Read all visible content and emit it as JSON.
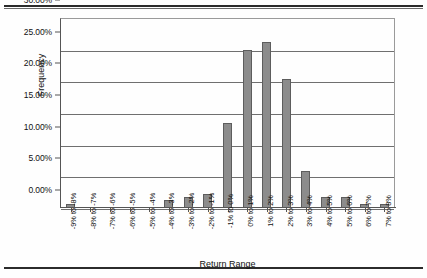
{
  "chart_data": {
    "type": "bar",
    "title": "",
    "xlabel": "Return Range",
    "ylabel": "Frequency",
    "ylim": [
      0,
      30
    ],
    "ytick_labels": [
      "30.00%",
      "25.00%",
      "20.00%",
      "15.00%",
      "10.00%",
      "5.00%",
      "0.00%"
    ],
    "ytick_values": [
      30,
      25,
      20,
      15,
      10,
      5,
      0
    ],
    "grid": true,
    "legend": "none",
    "bar_color": "#8c8c8c",
    "bar_edge_color": "#5d5d5d",
    "categories": [
      "-9% to -8%",
      "-8% to -7%",
      "-7% to -6%",
      "-6% to -5%",
      "-5% to -4%",
      "-4% to -3%",
      "-3% to -2%",
      "-2% to -1%",
      "-1% to 0%",
      "0% to 1%",
      "1% to 2%",
      "2% to 3%",
      "3% to 4%",
      "4% to 5%",
      "5% to 6%",
      "6% to 7%",
      "7% to 8%"
    ],
    "values": [
      0.6,
      0,
      0,
      0,
      0,
      1.2,
      1.7,
      2.2,
      13.4,
      25.0,
      26.2,
      20.4,
      5.9,
      1.7,
      1.7,
      0.6,
      0.6
    ]
  }
}
